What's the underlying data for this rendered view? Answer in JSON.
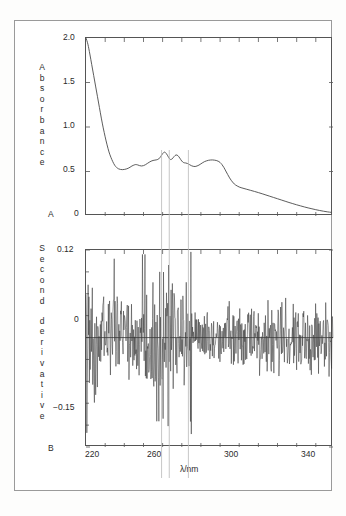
{
  "figure": {
    "panel_a_letter": "A",
    "panel_b_letter": "B",
    "x_axis_title": "λ/nm"
  },
  "panel_a": {
    "ylabel_chars": [
      "A",
      "b",
      "s",
      "o",
      "r",
      "b",
      "a",
      "n",
      "c",
      "e"
    ],
    "ytick_labels": [
      "2.0",
      "1.5",
      "1.0",
      "0.5",
      "0"
    ]
  },
  "panel_b": {
    "ylabel_chars": [
      "S",
      "e",
      "c",
      "o",
      "n",
      "d",
      "d",
      "e",
      "r",
      "i",
      "v",
      "a",
      "t",
      "i",
      "v",
      "e"
    ],
    "ytick_labels": [
      "0.12",
      "0",
      "−0.15"
    ]
  },
  "xtick_labels": [
    "220",
    "260",
    "300",
    "340"
  ],
  "colors": {
    "curve": "#4a4a4a",
    "derivative": "#3a3a3a",
    "axis": "#555555",
    "reference_line": "#b9b9b9",
    "frame": "#9a9a9a",
    "text": "#2b2b2b",
    "background": "#ffffff"
  },
  "chart_data": [
    {
      "type": "line",
      "title": "",
      "panel": "A",
      "xlabel": "λ/nm",
      "ylabel": "Absorbance",
      "xlim": [
        218,
        347
      ],
      "ylim": [
        0,
        2.0
      ],
      "xticks": [
        220,
        230,
        240,
        250,
        260,
        270,
        280,
        290,
        300,
        310,
        320,
        330,
        340
      ],
      "xticklabels": {
        "220": "220",
        "260": "260",
        "300": "300",
        "340": "340"
      },
      "yticks": [
        0,
        0.5,
        1.0,
        1.5,
        2.0
      ],
      "yticklabels": [
        "0",
        "0.5",
        "1.0",
        "1.5",
        "2.0"
      ],
      "grid": false,
      "legend": null,
      "reference_lines": [
        258,
        262,
        272
      ],
      "x": [
        218,
        219,
        220,
        221,
        222,
        223,
        224,
        225,
        226,
        227,
        228,
        229,
        230,
        231,
        232,
        233,
        234,
        235,
        236,
        237,
        238,
        239,
        240,
        241,
        242,
        243,
        244,
        245,
        246,
        247,
        248,
        249,
        250,
        251,
        252,
        253,
        254,
        255,
        256,
        257,
        258,
        259,
        260,
        261,
        262,
        263,
        264,
        265,
        266,
        267,
        268,
        269,
        270,
        271,
        272,
        273,
        274,
        275,
        276,
        277,
        278,
        279,
        280,
        281,
        282,
        283,
        284,
        285,
        286,
        287,
        288,
        289,
        290,
        291,
        292,
        293,
        294,
        295,
        296,
        298,
        300,
        302,
        304,
        306,
        308,
        310,
        312,
        314,
        316,
        318,
        320,
        322,
        324,
        326,
        328,
        330,
        332,
        334,
        336,
        338,
        340,
        342,
        344,
        346
      ],
      "y": [
        2.0,
        1.93,
        1.82,
        1.7,
        1.58,
        1.46,
        1.34,
        1.22,
        1.1,
        0.99,
        0.89,
        0.8,
        0.72,
        0.66,
        0.61,
        0.57,
        0.545,
        0.53,
        0.523,
        0.521,
        0.523,
        0.528,
        0.536,
        0.548,
        0.562,
        0.572,
        0.578,
        0.574,
        0.566,
        0.562,
        0.566,
        0.576,
        0.59,
        0.604,
        0.616,
        0.624,
        0.628,
        0.632,
        0.642,
        0.668,
        0.7,
        0.718,
        0.7,
        0.664,
        0.636,
        0.642,
        0.668,
        0.686,
        0.678,
        0.65,
        0.618,
        0.6,
        0.596,
        0.59,
        0.578,
        0.566,
        0.558,
        0.556,
        0.562,
        0.572,
        0.586,
        0.6,
        0.612,
        0.62,
        0.626,
        0.629,
        0.63,
        0.628,
        0.624,
        0.616,
        0.602,
        0.578,
        0.546,
        0.506,
        0.466,
        0.428,
        0.396,
        0.37,
        0.35,
        0.326,
        0.312,
        0.3,
        0.288,
        0.276,
        0.263,
        0.25,
        0.236,
        0.222,
        0.208,
        0.194,
        0.18,
        0.166,
        0.152,
        0.139,
        0.126,
        0.114,
        0.102,
        0.091,
        0.081,
        0.071,
        0.062,
        0.054,
        0.047,
        0.041
      ],
      "features": {
        "cutoff_absorbance_at_220nm": 2.0,
        "minimum": {
          "lambda": 237,
          "absorbance": 0.521
        },
        "fine_structure_peaks": [
          {
            "lambda": 243,
            "absorbance": 0.578
          },
          {
            "lambda": 259,
            "absorbance": 0.718
          },
          {
            "lambda": 265,
            "absorbance": 0.686
          },
          {
            "lambda": 284,
            "absorbance": 0.63
          }
        ],
        "shoulder_drop": {
          "from_lambda": 288,
          "to_lambda": 296
        },
        "baseline_tail_at_346nm": 0.041
      }
    },
    {
      "type": "line",
      "title": "",
      "panel": "B",
      "xlabel": "λ/nm",
      "ylabel": "Second derivative",
      "xlim": [
        218,
        347
      ],
      "ylim": [
        -0.15,
        0.12
      ],
      "xticks": [
        220,
        230,
        240,
        250,
        260,
        270,
        280,
        290,
        300,
        310,
        320,
        330,
        340
      ],
      "xticklabels": {
        "220": "220",
        "260": "260",
        "300": "300",
        "340": "340"
      },
      "yticks": [
        0.12,
        0,
        -0.15
      ],
      "yticklabels": [
        "0.12",
        "0",
        "−0.15"
      ],
      "grid": false,
      "legend": null,
      "zero_line": 0,
      "reference_lines": [
        258,
        262,
        272
      ],
      "description": "High-frequency noisy second-derivative trace oscillating about zero across the full 220-346 nm range, with the largest negative excursions (to about -0.13) clustered near 255-263 nm at the reference lines, and broad noise amplitude of roughly +/-0.04 elsewhere.",
      "noise_envelope": {
        "typical_amplitude": 0.04,
        "max_positive": 0.12,
        "max_negative": -0.135
      }
    }
  ]
}
